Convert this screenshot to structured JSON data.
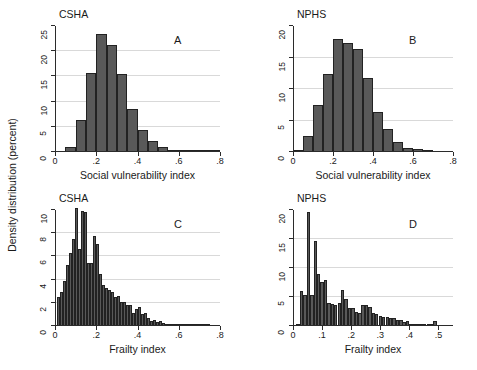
{
  "figure": {
    "ylabel": "Density distribution (percent)",
    "bar_color": "#595959",
    "bar_edge_color": "#222222",
    "axis_color": "#2b2b2b",
    "grid_color": "#d9d9d9"
  },
  "chart_data": [
    {
      "type": "bar",
      "panel_letter": "A",
      "title": "CSHA",
      "xlabel": "Social vulnerability index",
      "ylabel": "Density distribution (percent)",
      "xlim": [
        0,
        0.8
      ],
      "ylim": [
        0,
        25
      ],
      "xticks": [
        0,
        0.2,
        0.4,
        0.6,
        0.8
      ],
      "xticklabels": [
        "0",
        ".2",
        ".4",
        ".6",
        ".8"
      ],
      "yticks": [
        0,
        5,
        10,
        15,
        20,
        25
      ],
      "yticklabels": [
        "0",
        "5",
        "10",
        "15",
        "20",
        "25"
      ],
      "grid": "horizontal",
      "bin_width": 0.05,
      "bin_starts": [
        0.05,
        0.1,
        0.15,
        0.2,
        0.25,
        0.3,
        0.35,
        0.4,
        0.45,
        0.5,
        0.55,
        0.6,
        0.65,
        0.7,
        0.75
      ],
      "values": [
        1.0,
        6.3,
        15.6,
        23.4,
        21.2,
        15.5,
        8.6,
        4.3,
        2.1,
        0.9,
        0.4,
        0.2,
        0.15,
        0.1,
        0.1
      ]
    },
    {
      "type": "bar",
      "panel_letter": "B",
      "title": "NPHS",
      "xlabel": "Social vulnerability index",
      "ylabel": "Density distribution (percent)",
      "xlim": [
        0,
        0.8
      ],
      "ylim": [
        0,
        20
      ],
      "xticks": [
        0,
        0.2,
        0.4,
        0.6,
        0.8
      ],
      "xticklabels": [
        "0",
        ".2",
        ".4",
        ".6",
        ".8"
      ],
      "yticks": [
        0,
        5,
        10,
        15,
        20
      ],
      "yticklabels": [
        "0",
        "5",
        "10",
        "15",
        "20"
      ],
      "grid": "horizontal",
      "bin_width": 0.05,
      "bin_starts": [
        0.0,
        0.05,
        0.1,
        0.15,
        0.2,
        0.25,
        0.3,
        0.35,
        0.4,
        0.45,
        0.5,
        0.55,
        0.6,
        0.65
      ],
      "values": [
        0.3,
        2.5,
        7.4,
        12.4,
        17.9,
        17.3,
        16.3,
        11.8,
        6.3,
        3.6,
        1.6,
        0.7,
        0.5,
        0.15
      ]
    },
    {
      "type": "bar",
      "panel_letter": "C",
      "title": "CSHA",
      "xlabel": "Frailty index",
      "ylabel": "Density distribution (percent)",
      "xlim": [
        0,
        0.8
      ],
      "ylim": [
        0,
        10
      ],
      "xticks": [
        0,
        0.2,
        0.4,
        0.6,
        0.8
      ],
      "xticklabels": [
        "0",
        ".2",
        ".4",
        ".6",
        ".8"
      ],
      "yticks": [
        0,
        2,
        4,
        6,
        8,
        10
      ],
      "yticklabels": [
        "0",
        "2",
        "4",
        "6",
        "8",
        "10"
      ],
      "grid": "horizontal",
      "bin_width": 0.0145,
      "bin_starts": [
        0.01,
        0.025,
        0.039,
        0.054,
        0.068,
        0.083,
        0.097,
        0.112,
        0.126,
        0.141,
        0.155,
        0.17,
        0.184,
        0.199,
        0.213,
        0.228,
        0.242,
        0.257,
        0.271,
        0.286,
        0.3,
        0.315,
        0.329,
        0.344,
        0.358,
        0.373,
        0.387,
        0.402,
        0.416,
        0.431,
        0.445,
        0.46,
        0.474,
        0.489,
        0.503,
        0.518,
        0.532,
        0.547,
        0.561,
        0.576,
        0.59,
        0.605,
        0.619,
        0.634,
        0.648,
        0.663,
        0.677,
        0.692,
        0.706,
        0.721,
        0.735
      ],
      "values": [
        2.5,
        2.9,
        3.9,
        5.3,
        6.3,
        7.5,
        10.2,
        6.6,
        9.9,
        9.8,
        5.4,
        5.4,
        7.8,
        7.1,
        4.5,
        3.5,
        3.3,
        3.1,
        2.9,
        2.5,
        2.6,
        2.1,
        2.1,
        1.8,
        1.8,
        1.1,
        1.5,
        1.6,
        1.0,
        1.1,
        0.7,
        0.4,
        0.55,
        0.35,
        0.4,
        0.3,
        0.2,
        0.18,
        0.12,
        0.1,
        0.08,
        0.08,
        0.06,
        0.05,
        0.05,
        0.05,
        0.05,
        0.04,
        0.04,
        0.04,
        0.04
      ]
    },
    {
      "type": "bar",
      "panel_letter": "D",
      "title": "NPHS",
      "xlabel": "Frailty index",
      "ylabel": "Density distribution (percent)",
      "xlim": [
        0,
        0.55
      ],
      "ylim": [
        0,
        20
      ],
      "xticks": [
        0,
        0.1,
        0.2,
        0.3,
        0.4,
        0.5
      ],
      "xticklabels": [
        "0",
        ".1",
        ".2",
        ".3",
        ".4",
        ".5"
      ],
      "yticks": [
        0,
        5,
        10,
        15,
        20
      ],
      "yticklabels": [
        "0",
        "5",
        "10",
        "15",
        "20"
      ],
      "grid": "horizontal",
      "bin_width": 0.0118,
      "bin_starts": [
        0.012,
        0.024,
        0.035,
        0.047,
        0.059,
        0.071,
        0.082,
        0.094,
        0.106,
        0.118,
        0.129,
        0.141,
        0.153,
        0.165,
        0.176,
        0.188,
        0.2,
        0.212,
        0.224,
        0.235,
        0.247,
        0.259,
        0.271,
        0.282,
        0.294,
        0.306,
        0.318,
        0.329,
        0.341,
        0.353,
        0.365,
        0.376,
        0.388,
        0.4,
        0.412,
        0.424,
        0.435,
        0.447,
        0.459,
        0.471,
        0.482
      ],
      "values": [
        0.3,
        6.1,
        5.4,
        19.7,
        5.4,
        14.7,
        9.0,
        7.6,
        8.0,
        4.0,
        3.8,
        3.7,
        3.9,
        6.2,
        4.6,
        3.1,
        3.1,
        2.5,
        2.3,
        3.6,
        3.6,
        3.3,
        2.2,
        2.0,
        1.8,
        1.5,
        1.5,
        1.3,
        1.4,
        1.0,
        1.0,
        0.7,
        0.8,
        0.3,
        0.4,
        0.4,
        0.3,
        0.25,
        0.2,
        0.15,
        0.9
      ]
    }
  ]
}
